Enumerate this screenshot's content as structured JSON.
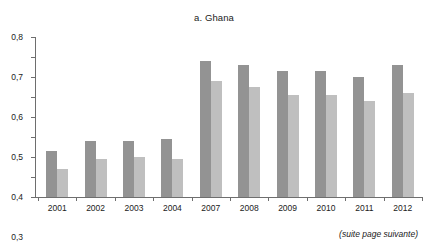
{
  "chart_data": {
    "type": "bar",
    "title": "a. Ghana",
    "xlabel": "",
    "ylabel": "",
    "categories": [
      "2001",
      "2002",
      "2003",
      "2004",
      "2007",
      "2008",
      "2009",
      "2010",
      "2011",
      "2012"
    ],
    "series": [
      {
        "name": "serie-1",
        "color": "#939393",
        "values": [
          0.23,
          0.28,
          0.28,
          0.29,
          0.68,
          0.66,
          0.63,
          0.63,
          0.6,
          0.66
        ]
      },
      {
        "name": "serie-2",
        "color": "#bfbfbf",
        "values": [
          0.14,
          0.19,
          0.2,
          0.19,
          0.58,
          0.55,
          0.51,
          0.51,
          0.48,
          0.52
        ]
      }
    ],
    "ylim": [
      0,
      0.8
    ],
    "ytick_values": [
      0,
      0.1,
      0.2,
      0.3,
      0.4,
      0.5,
      0.6,
      0.7,
      0.8
    ],
    "ytick_labels": [
      "0",
      "0,1",
      "0,2",
      "0,3",
      "0,4",
      "0,5",
      "0,6",
      "0,7",
      "0,8"
    ],
    "grid": false,
    "legend": null
  },
  "footer": {
    "note": "(suite page suivante)"
  }
}
